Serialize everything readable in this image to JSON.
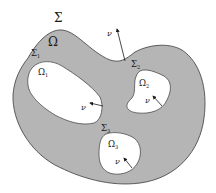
{
  "figure": {
    "colors": {
      "domain_fill": "#b5b5b5",
      "hole_fill": "#ffffff",
      "stroke": "#3a3a3a",
      "arrow": "#1a1a1a"
    }
  },
  "labels": {
    "outer_boundary": {
      "base": "Σ",
      "sub": ""
    },
    "domain": {
      "base": "Ω",
      "sub": ""
    },
    "boundary_1": {
      "base": "Σ",
      "sub": "1"
    },
    "boundary_2": {
      "base": "Σ",
      "sub": "2"
    },
    "boundary_3": {
      "base": "Σ",
      "sub": "3"
    },
    "hole_1": {
      "base": "Ω",
      "sub": "1"
    },
    "hole_2": {
      "base": "Ω",
      "sub": "2"
    },
    "hole_3": {
      "base": "Ω",
      "sub": "3"
    },
    "normal_outer": "ν",
    "normal_1": "ν",
    "normal_2": "ν",
    "normal_3": "ν"
  }
}
